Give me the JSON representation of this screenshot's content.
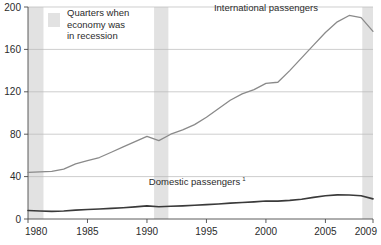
{
  "chart_data": {
    "type": "line",
    "title": "",
    "xlabel": "",
    "ylabel": "",
    "xlim": [
      1980,
      2009
    ],
    "ylim": [
      0,
      200
    ],
    "ytick_labels": [
      "0",
      "40",
      "80",
      "120",
      "160",
      "200"
    ],
    "yticks": [
      0,
      40,
      80,
      120,
      160,
      200
    ],
    "xtick_labels": [
      "1980",
      "1985",
      "1990",
      "1995",
      "2000",
      "2005",
      "2009"
    ],
    "xticks": [
      1980,
      1985,
      1990,
      1995,
      2000,
      2005,
      2009
    ],
    "grid": "horizontal",
    "legend_position": "top-left-inside",
    "x": [
      1980,
      1981,
      1982,
      1983,
      1984,
      1985,
      1986,
      1987,
      1988,
      1989,
      1990,
      1991,
      1992,
      1993,
      1994,
      1995,
      1996,
      1997,
      1998,
      1999,
      2000,
      2001,
      2002,
      2003,
      2004,
      2005,
      2006,
      2007,
      2008,
      2009
    ],
    "series": [
      {
        "name": "International passengers",
        "color": "#8a8a8a",
        "stroke_width": 1.3,
        "label_x": 2000,
        "label_y": 196,
        "values": [
          44,
          44.5,
          45,
          47,
          52,
          55,
          58,
          63,
          68,
          73,
          78,
          74,
          80,
          84,
          89,
          96,
          104,
          112,
          118,
          122,
          128,
          129,
          140,
          152,
          164,
          176,
          186,
          192,
          190,
          177
        ]
      },
      {
        "name": "Domestic passengers",
        "footnote": "1",
        "color": "#3a3a3a",
        "stroke_width": 1.6,
        "label_x": 1994,
        "label_y": 32,
        "values": [
          8,
          7.5,
          7.2,
          7.6,
          8.4,
          9,
          9.4,
          10,
          10.6,
          11.4,
          12.4,
          11.6,
          12,
          12.4,
          13,
          13.6,
          14.2,
          15,
          15.6,
          16.2,
          17,
          16.9,
          17.6,
          18.6,
          20.4,
          22,
          22.8,
          22.7,
          22,
          19
        ]
      }
    ],
    "recession_bands": [
      {
        "start": 1980.0,
        "end": 1981.3,
        "label": "recession-band-1"
      },
      {
        "start": 1990.6,
        "end": 1991.8,
        "label": "recession-band-2"
      },
      {
        "start": 2008.1,
        "end": 2009.3,
        "label": "recession-band-3"
      }
    ],
    "legend": {
      "swatch_color": "#e2e2e2",
      "lines": [
        "Quarters when",
        "economy was",
        "in recession"
      ]
    }
  }
}
